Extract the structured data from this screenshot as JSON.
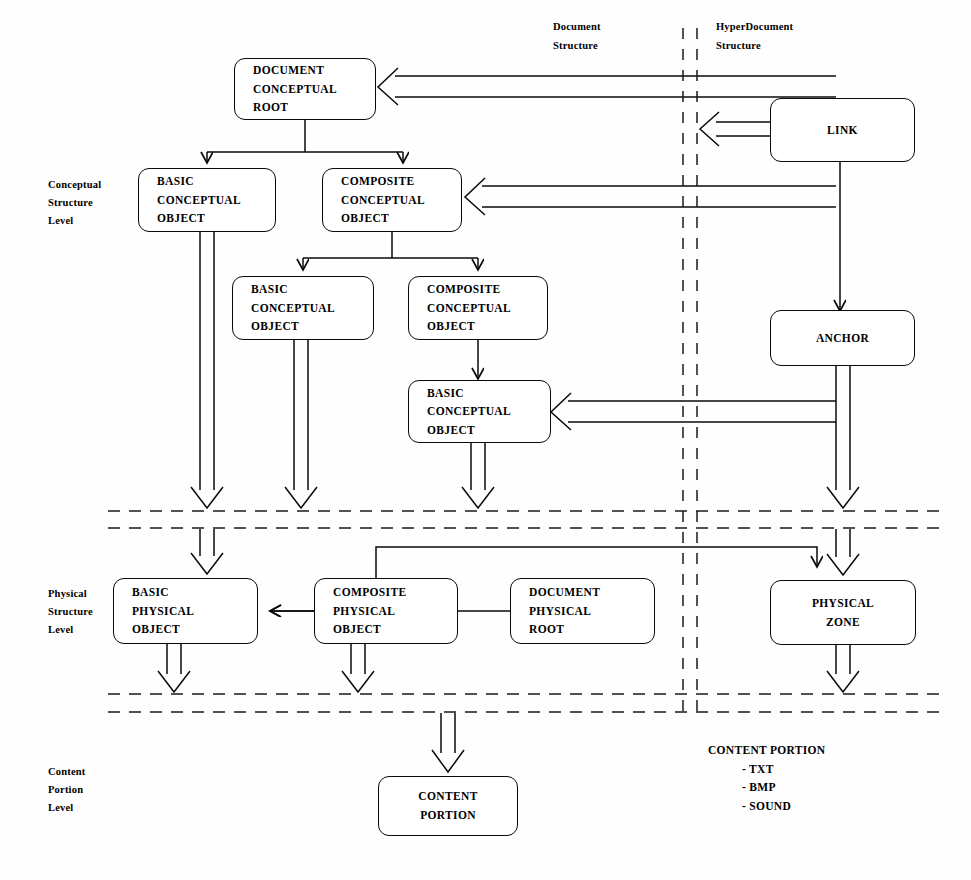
{
  "diagram": {
    "column_headers": [
      {
        "id": "document-structure",
        "lines": [
          "Document",
          "Structure"
        ]
      },
      {
        "id": "hyperdocument-structure",
        "lines": [
          "HyperDocument",
          "Structure"
        ]
      }
    ],
    "level_labels": [
      {
        "id": "conceptual-structure-level",
        "lines": [
          "Conceptual",
          "Structure",
          "Level"
        ]
      },
      {
        "id": "physical-structure-level",
        "lines": [
          "Physical",
          "Structure",
          "Level"
        ]
      },
      {
        "id": "content-portion-level",
        "lines": [
          "Content",
          "Portion",
          "Level"
        ]
      }
    ],
    "nodes": [
      {
        "id": "document-conceptual-root",
        "lines": [
          "DOCUMENT",
          "CONCEPTUAL",
          "ROOT"
        ]
      },
      {
        "id": "basic-conceptual-object-1",
        "lines": [
          "BASIC",
          "CONCEPTUAL",
          "OBJECT"
        ]
      },
      {
        "id": "composite-conceptual-object-1",
        "lines": [
          "COMPOSITE",
          "CONCEPTUAL",
          "OBJECT"
        ]
      },
      {
        "id": "basic-conceptual-object-2",
        "lines": [
          "BASIC",
          "CONCEPTUAL",
          "OBJECT"
        ]
      },
      {
        "id": "composite-conceptual-object-2",
        "lines": [
          "COMPOSITE",
          "CONCEPTUAL",
          "OBJECT"
        ]
      },
      {
        "id": "basic-conceptual-object-3",
        "lines": [
          "BASIC",
          "CONCEPTUAL",
          "OBJECT"
        ]
      },
      {
        "id": "link",
        "lines": [
          "LINK"
        ]
      },
      {
        "id": "anchor",
        "lines": [
          "ANCHOR"
        ]
      },
      {
        "id": "basic-physical-object",
        "lines": [
          "BASIC",
          "PHYSICAL",
          "OBJECT"
        ]
      },
      {
        "id": "composite-physical-object",
        "lines": [
          "COMPOSITE",
          "PHYSICAL",
          "OBJECT"
        ]
      },
      {
        "id": "document-physical-root",
        "lines": [
          "DOCUMENT",
          "PHYSICAL",
          "ROOT"
        ]
      },
      {
        "id": "physical-zone",
        "lines": [
          "PHYSICAL",
          "ZONE"
        ]
      },
      {
        "id": "content-portion",
        "lines": [
          "CONTENT",
          "PORTION"
        ]
      }
    ],
    "legend": {
      "title": "CONTENT PORTION",
      "items": [
        "- TXT",
        "- BMP",
        "- SOUND"
      ]
    },
    "colors": {
      "stroke": "#0a0a0a",
      "background": "#fefefe"
    }
  }
}
